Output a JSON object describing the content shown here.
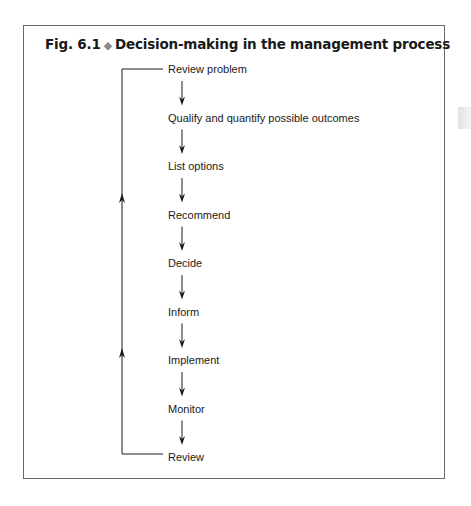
{
  "figure": {
    "number": "Fig. 6.1",
    "separator_icon": "diamond-icon",
    "title": "Decision-making in the management process"
  },
  "steps": [
    {
      "label": "Review problem",
      "y": 69
    },
    {
      "label": "Qualify and quantify possible outcomes",
      "y": 117.5
    },
    {
      "label": "List options",
      "y": 166
    },
    {
      "label": "Recommend",
      "y": 214.5
    },
    {
      "label": "Decide",
      "y": 263
    },
    {
      "label": "Inform",
      "y": 311.5
    },
    {
      "label": "Implement",
      "y": 360
    },
    {
      "label": "Monitor",
      "y": 408.5
    },
    {
      "label": "Review",
      "y": 457
    }
  ],
  "feedback_loop": {
    "from": "Review",
    "to": "Review problem",
    "direction": "upward"
  },
  "colors": {
    "line": "#1a1a1a",
    "frame": "#6a6a6a",
    "diamond": "#8a8a8a"
  }
}
